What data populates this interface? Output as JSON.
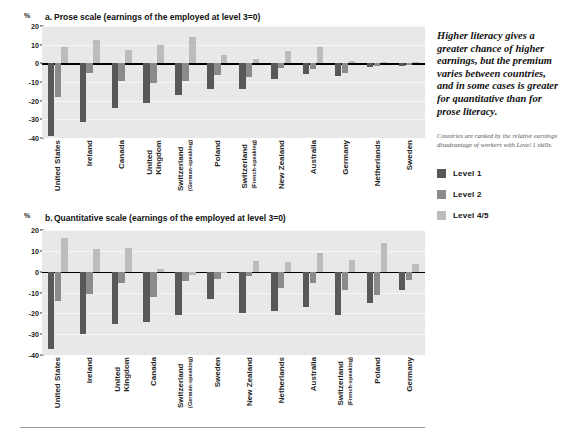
{
  "figure": {
    "axis_unit": "%",
    "sidebar": {
      "pullquote": "Higher literacy gives a greater chance of higher earnings, but the premium varies between countries, and in some cases is greater for quantitative than for prose literacy.",
      "note": "Countries are ranked by the relative earnings disadvantage of workers with Level 1 skills.",
      "legend": [
        {
          "label": "Level 1",
          "color": "#58585a",
          "key": "l1"
        },
        {
          "label": "Level 2",
          "color": "#8b8b8e",
          "key": "l2"
        },
        {
          "label": "Level 4/5",
          "color": "#bcbcbf",
          "key": "l3"
        }
      ]
    }
  },
  "chart_data": [
    {
      "id": "panel-a",
      "type": "bar",
      "panel_letter": "a.",
      "title": "Prose scale (earnings of the employed at level 3=0)",
      "xlabel": "",
      "ylabel": "%",
      "ylim": [
        -40,
        20
      ],
      "yticks": [
        20,
        10,
        0,
        -10,
        -20,
        -30,
        -40
      ],
      "ytick_labels": [
        "20",
        "10",
        "0",
        "-10",
        "-20",
        "-30",
        "-40"
      ],
      "grid": true,
      "legend_position": "right",
      "categories": [
        "United States",
        "Ireland",
        "Canada",
        "United Kingdom",
        "Switzerland (German-speaking)",
        "Poland",
        "Switzerland (French-speaking)",
        "New Zealand",
        "Australia",
        "Germany",
        "Netherlands",
        "Sweden"
      ],
      "category_lines": [
        [
          "United States"
        ],
        [
          "Ireland"
        ],
        [
          "Canada"
        ],
        [
          "United",
          "Kingdom"
        ],
        [
          "Switzerland",
          "(German-speaking)"
        ],
        [
          "Poland"
        ],
        [
          "Switzerland",
          "(French-speaking)"
        ],
        [
          "New Zealand"
        ],
        [
          "Australia"
        ],
        [
          "Germany"
        ],
        [
          "Netherlands"
        ],
        [
          "Sweden"
        ]
      ],
      "series": [
        {
          "name": "Level 1",
          "key": "l1",
          "values": [
            -39,
            -31.5,
            -24,
            -21.5,
            -17,
            -13.5,
            -14,
            -8.5,
            -5.5,
            -7,
            -2,
            -1.5
          ]
        },
        {
          "name": "Level 2",
          "key": "l2",
          "values": [
            -18,
            -5,
            -9.5,
            -10.5,
            -9.5,
            -6,
            -7.5,
            -2.5,
            -3,
            -5,
            -1.5,
            -1
          ]
        },
        {
          "name": "Level 4/5",
          "key": "l3",
          "values": [
            8.5,
            12.5,
            7,
            10,
            14,
            4.5,
            2.5,
            6.5,
            8.5,
            1,
            0.5,
            0.5
          ]
        }
      ]
    },
    {
      "id": "panel-b",
      "type": "bar",
      "panel_letter": "b.",
      "title": "Quantitative scale (earnings of the employed at level 3=0)",
      "xlabel": "",
      "ylabel": "%",
      "ylim": [
        -40,
        20
      ],
      "yticks": [
        20,
        10,
        0,
        -10,
        -20,
        -30,
        -40
      ],
      "ytick_labels": [
        "20",
        "10",
        "0",
        "-10",
        "-20",
        "-30",
        "-40"
      ],
      "grid": true,
      "legend_position": "right",
      "categories": [
        "United States",
        "Ireland",
        "United Kingdom",
        "Canada",
        "Switzerland (German-speaking)",
        "Sweden",
        "New Zealand",
        "Netherlands",
        "Australia",
        "Switzerland (French-speaking)",
        "Poland",
        "Germany"
      ],
      "category_lines": [
        [
          "United States"
        ],
        [
          "Ireland"
        ],
        [
          "United",
          "Kingdom"
        ],
        [
          "Canada"
        ],
        [
          "Switzerland",
          "(German-speaking)"
        ],
        [
          "Sweden"
        ],
        [
          "New Zealand"
        ],
        [
          "Netherlands"
        ],
        [
          "Australia"
        ],
        [
          "Switzerland",
          "(French-speaking)"
        ],
        [
          "Poland"
        ],
        [
          "Germany"
        ]
      ],
      "series": [
        {
          "name": "Level 1",
          "key": "l1",
          "values": [
            -37,
            -30,
            -25,
            -24,
            -21,
            -13,
            -20,
            -19,
            -17,
            -21,
            -15,
            -9
          ]
        },
        {
          "name": "Level 2",
          "key": "l2",
          "values": [
            -14,
            -10.5,
            -5.5,
            -12,
            -4.5,
            -3.5,
            -2,
            -8,
            -5.5,
            -9,
            -11,
            -4
          ]
        },
        {
          "name": "Level 4/5",
          "key": "l3",
          "values": [
            16,
            11,
            11.5,
            1.5,
            -1.5,
            -0.5,
            5,
            4.5,
            9,
            5.5,
            14,
            3.5
          ]
        }
      ]
    }
  ]
}
